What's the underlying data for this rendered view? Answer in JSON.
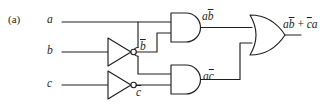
{
  "figure": {
    "label": "(a)",
    "caption": ""
  },
  "inputs": [
    {
      "id": "a",
      "label": "a",
      "y": 22
    },
    {
      "id": "b",
      "label": "b",
      "y": 52
    },
    {
      "id": "c",
      "label": "c",
      "y": 85
    }
  ],
  "gates": [
    {
      "id": "inverter-b",
      "type": "NOT",
      "icon": "not-gate-icon",
      "input": "b",
      "output_label_base": "b",
      "output_label": "b̄"
    },
    {
      "id": "inverter-c",
      "type": "NOT",
      "icon": "not-gate-icon",
      "input": "c",
      "output_label_base": "c",
      "output_label": "c̄"
    },
    {
      "id": "and-gate-top",
      "type": "AND",
      "icon": "and-gate-icon",
      "inputs": [
        "a",
        "b̄"
      ],
      "output_label": "ab̄"
    },
    {
      "id": "and-gate-bottom",
      "type": "AND",
      "icon": "and-gate-icon",
      "inputs": [
        "a",
        "c̄"
      ],
      "output_label": "ac̄"
    },
    {
      "id": "or-gate",
      "type": "OR",
      "icon": "or-gate-icon",
      "inputs": [
        "ab̄",
        "ac̄"
      ],
      "output_label": "ab̄ + c̄a"
    }
  ],
  "labels": {
    "input_a": "a",
    "input_b": "b",
    "input_c": "c",
    "b_bar_base": "b",
    "c_bar_base": "c",
    "and_top_out_a": "a",
    "and_top_out_bbar": "b",
    "and_bottom_out_a": "a",
    "and_bottom_out_cbar": "c",
    "output_term1_a": "a",
    "output_term1_bbar": "b",
    "output_plus": " + ",
    "output_term2_cbar": "c",
    "output_term2_a": "a"
  },
  "colors": {
    "line": "#231f20",
    "background": "#ffffff",
    "gate_fill": "#ffffff"
  }
}
